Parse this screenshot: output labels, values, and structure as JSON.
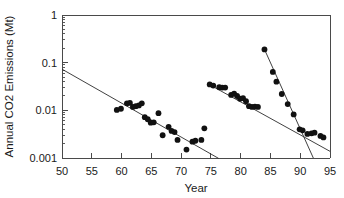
{
  "chart_data": {
    "type": "scatter",
    "title": "",
    "xlabel": "Year",
    "ylabel": "Annual CO2 Emissions (Mt)",
    "xlim": [
      50,
      95
    ],
    "ylim": [
      0.001,
      1
    ],
    "yscale": "log",
    "grid": false,
    "legend": "none",
    "x_ticks": [
      50,
      55,
      60,
      65,
      70,
      75,
      80,
      85,
      90,
      95
    ],
    "x_tick_labels": [
      "50",
      "55",
      "60",
      "65",
      "70",
      "75",
      "80",
      "85",
      "90",
      "95"
    ],
    "y_ticks": [
      0.001,
      0.01,
      0.1,
      1
    ],
    "y_tick_labels": [
      "0.001",
      "0.01",
      "0.1",
      "1"
    ],
    "marker": "filled-circle",
    "marker_color": "#111111",
    "series": [
      {
        "name": "Period 1 (1959-1974)",
        "x": [
          59.2,
          59.9,
          60.9,
          61.4,
          61.9,
          62.4,
          62.9,
          63.4,
          63.9,
          64.4,
          64.9,
          65.4,
          66.2,
          66.9,
          67.9,
          68.4,
          68.9,
          69.4,
          70.9,
          71.9,
          72.4,
          73.4,
          73.9
        ],
        "y": [
          0.0102,
          0.0108,
          0.014,
          0.0143,
          0.0118,
          0.0122,
          0.0127,
          0.014,
          0.0072,
          0.0065,
          0.0055,
          0.0056,
          0.0087,
          0.003,
          0.0045,
          0.0037,
          0.0035,
          0.0024,
          0.0015,
          0.0022,
          0.0023,
          0.0024,
          0.0042
        ]
      },
      {
        "name": "Period 2 (1975-1983)",
        "x": [
          74.8,
          75.4,
          76.4,
          76.9,
          77.4,
          78.4,
          78.9,
          79.4,
          79.9,
          80.4,
          80.9,
          81.4,
          81.9,
          82.4,
          82.9
        ],
        "y": [
          0.035,
          0.033,
          0.0305,
          0.03,
          0.03,
          0.021,
          0.0225,
          0.02,
          0.0175,
          0.018,
          0.0155,
          0.0122,
          0.0118,
          0.012,
          0.0118
        ]
      },
      {
        "name": "Period 3 (1984-1994)",
        "x": [
          84.0,
          85.4,
          86.0,
          86.9,
          87.9,
          88.9,
          89.9,
          90.4,
          91.2,
          91.9,
          92.4,
          93.4,
          93.9
        ],
        "y": [
          0.19,
          0.064,
          0.04,
          0.022,
          0.0135,
          0.0082,
          0.004,
          0.0038,
          0.0032,
          0.0033,
          0.0034,
          0.0029,
          0.0027
        ]
      }
    ],
    "trend_lines": [
      {
        "name": "trend-period-1",
        "x1": 50.0,
        "y1": 0.073,
        "x2": 76.3,
        "y2": 0.00098
      },
      {
        "name": "trend-period-2",
        "x1": 74.6,
        "y1": 0.0355,
        "x2": 95.0,
        "y2": 0.00138
      },
      {
        "name": "trend-period-3",
        "x1": 84.0,
        "y1": 0.19,
        "x2": 92.2,
        "y2": 0.001
      }
    ]
  }
}
